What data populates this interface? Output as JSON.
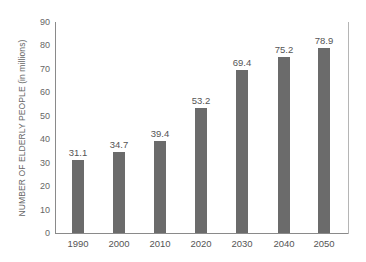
{
  "chart_data": {
    "type": "bar",
    "title": "",
    "xlabel": "",
    "ylabel": "NUMBER OF  ELDERLY PEOPLE (in millions)",
    "categories": [
      "1990",
      "2000",
      "2010",
      "2020",
      "2030",
      "2040",
      "2050"
    ],
    "values": [
      31.1,
      34.7,
      39.4,
      53.2,
      69.4,
      75.2,
      78.9
    ],
    "data_labels": [
      "31.1",
      "34.7",
      "39.4",
      "53.2",
      "69.4",
      "75.2",
      "78.9"
    ],
    "yticks": [
      "0",
      "10",
      "20",
      "30",
      "40",
      "50",
      "60",
      "70",
      "80",
      "90"
    ],
    "ylim": [
      0,
      90
    ],
    "grid": false,
    "legend": null,
    "bar_color": "#6b6b6b"
  }
}
